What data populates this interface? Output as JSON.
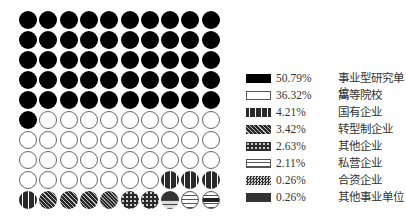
{
  "chart_data": {
    "type": "waffle",
    "grid": {
      "rows": 10,
      "cols": 10
    },
    "title": "",
    "legend_position": "right",
    "series": [
      {
        "name": "事业型研究单位",
        "percent": 50.79,
        "cells": 51,
        "pattern": "solid"
      },
      {
        "name": "高等院校",
        "percent": 36.32,
        "cells": 36,
        "pattern": "empty"
      },
      {
        "name": "国有企业",
        "percent": 4.21,
        "cells": 4,
        "pattern": "vertical"
      },
      {
        "name": "转型制企业",
        "percent": 3.42,
        "cells": 3,
        "pattern": "diagonal"
      },
      {
        "name": "其他企业",
        "percent": 2.63,
        "cells": 3,
        "pattern": "wave"
      },
      {
        "name": "私营企业",
        "percent": 2.11,
        "cells": 2,
        "pattern": "brick"
      },
      {
        "name": "合资企业",
        "percent": 0.26,
        "cells": 0,
        "pattern": "checker"
      },
      {
        "name": "其他事业单位",
        "percent": 0.26,
        "cells": 1,
        "pattern": "bar"
      }
    ]
  },
  "legend": [
    {
      "pct": "50.79%",
      "label": "事业型研究单位"
    },
    {
      "pct": "36.32%",
      "label": "高等院校"
    },
    {
      "pct": "4.21%",
      "label": "国有企业"
    },
    {
      "pct": "3.42%",
      "label": "转型制企业"
    },
    {
      "pct": "2.63%",
      "label": "其他企业"
    },
    {
      "pct": "2.11%",
      "label": "私营企业"
    },
    {
      "pct": "0.26%",
      "label": "合资企业"
    },
    {
      "pct": "0.26%",
      "label": "其他事业单位"
    }
  ],
  "cell_patterns": [
    "solid",
    "solid",
    "solid",
    "solid",
    "solid",
    "solid",
    "solid",
    "solid",
    "solid",
    "solid",
    "solid",
    "solid",
    "solid",
    "solid",
    "solid",
    "solid",
    "solid",
    "solid",
    "solid",
    "solid",
    "solid",
    "solid",
    "solid",
    "solid",
    "solid",
    "solid",
    "solid",
    "solid",
    "solid",
    "solid",
    "solid",
    "solid",
    "solid",
    "solid",
    "solid",
    "solid",
    "solid",
    "solid",
    "solid",
    "solid",
    "solid",
    "solid",
    "solid",
    "solid",
    "solid",
    "solid",
    "solid",
    "solid",
    "solid",
    "solid",
    "solid",
    "empty",
    "empty",
    "empty",
    "empty",
    "empty",
    "empty",
    "empty",
    "empty",
    "empty",
    "empty",
    "empty",
    "empty",
    "empty",
    "empty",
    "empty",
    "empty",
    "empty",
    "empty",
    "empty",
    "empty",
    "empty",
    "empty",
    "empty",
    "empty",
    "empty",
    "empty",
    "empty",
    "empty",
    "empty",
    "empty",
    "empty",
    "empty",
    "empty",
    "empty",
    "empty",
    "empty",
    "vertical",
    "vertical",
    "vertical",
    "vertical",
    "diagonal",
    "diagonal",
    "diagonal",
    "diagonal-dense",
    "wave",
    "wave",
    "wave-brick",
    "brick",
    "brick-bar"
  ]
}
